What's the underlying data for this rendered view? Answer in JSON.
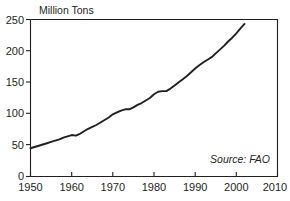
{
  "chart_data": {
    "type": "line",
    "title": "",
    "subtitle": "",
    "xlabel": "",
    "ylabel": "Million Tons",
    "ylabel_position": "top-left-above-axis",
    "xlim": [
      1950,
      2010
    ],
    "ylim": [
      0,
      250
    ],
    "grid": false,
    "legend": false,
    "legend_position": "none",
    "annotations": [
      {
        "name": "source",
        "text": "Source: FAO",
        "position": "bottom-right-inside-plot",
        "style": "italic"
      }
    ],
    "yticks": [
      0,
      50,
      100,
      150,
      200,
      250
    ],
    "ytick_labels": [
      "0",
      "50",
      "100",
      "150",
      "200",
      "250"
    ],
    "xticks": [
      1950,
      1960,
      1970,
      1980,
      1990,
      2000,
      2010
    ],
    "xtick_labels": [
      "1950",
      "1960",
      "1970",
      "1980",
      "1990",
      "2000",
      "2010"
    ],
    "line_color": "#231f20",
    "series": [
      {
        "name": "World Production",
        "x": [
          1950,
          1951,
          1952,
          1953,
          1954,
          1955,
          1956,
          1957,
          1958,
          1959,
          1960,
          1961,
          1962,
          1963,
          1964,
          1965,
          1966,
          1967,
          1968,
          1969,
          1970,
          1971,
          1972,
          1973,
          1974,
          1975,
          1976,
          1977,
          1978,
          1979,
          1980,
          1981,
          1982,
          1983,
          1984,
          1985,
          1986,
          1987,
          1988,
          1989,
          1990,
          1991,
          1992,
          1993,
          1994,
          1995,
          1996,
          1997,
          1998,
          1999,
          2000,
          2001,
          2002
        ],
        "values": [
          45,
          47,
          49,
          51,
          53,
          55,
          57,
          59,
          62,
          64,
          66,
          65,
          68,
          72,
          76,
          79,
          82,
          86,
          90,
          94,
          99,
          102,
          105,
          107,
          107,
          110,
          114,
          117,
          121,
          125,
          131,
          135,
          136,
          136,
          140,
          145,
          150,
          155,
          160,
          166,
          172,
          177,
          182,
          186,
          190,
          196,
          202,
          208,
          215,
          221,
          228,
          236,
          243
        ]
      }
    ]
  },
  "axis": {
    "y_title": "Million Tons"
  },
  "source": {
    "text": "Source: FAO"
  }
}
